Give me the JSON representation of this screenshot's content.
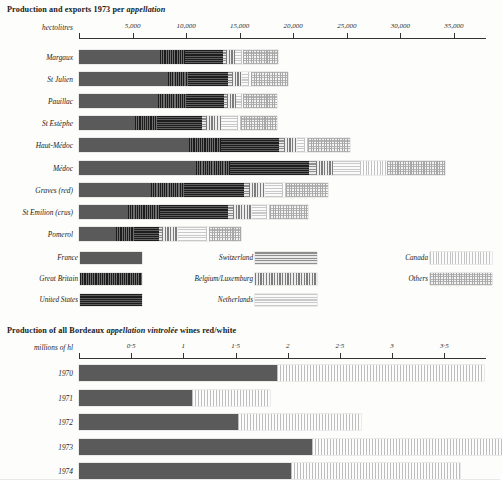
{
  "top_chart": {
    "title_plain_1": "Production and exports 1973 per ",
    "title_italic": "appellation",
    "axis_name": "hectolitres",
    "ticks": [
      "5,000",
      "10,000",
      "15,000",
      "20,000",
      "25,000",
      "30,000",
      "35,000"
    ],
    "tick_values": [
      5000,
      10000,
      15000,
      20000,
      25000,
      30000,
      35000
    ],
    "axis_max": 38000
  },
  "legend": {
    "col1": [
      {
        "label": "France",
        "pattern": "p-france"
      },
      {
        "label": "Great Britain",
        "pattern": "p-gb"
      },
      {
        "label": "United States",
        "pattern": "p-us"
      }
    ],
    "col2": [
      {
        "label": "Switzerland",
        "pattern": "p-swiss"
      },
      {
        "label": "Belgium/Luxemburg",
        "pattern": "p-belux"
      },
      {
        "label": "Netherlands",
        "pattern": "p-neth"
      }
    ],
    "col3": [
      {
        "label": "Canada",
        "pattern": "p-canada"
      },
      {
        "label": "Others",
        "pattern": "p-others"
      }
    ]
  },
  "bottom_chart": {
    "title_plain_1": "Production of all Bordeaux ",
    "title_italic": "appellation vintrolée",
    "title_plain_2": " wines red/white",
    "axis_name": "millions of hl",
    "ticks": [
      "0·5",
      "1",
      "1·5",
      "2",
      "2·5",
      "3",
      "3·5"
    ],
    "tick_values": [
      0.5,
      1,
      1.5,
      2,
      2.5,
      3,
      3.5
    ],
    "axis_max": 3.9
  },
  "chart_data": [
    {
      "type": "bar",
      "orientation": "horizontal",
      "stacked": true,
      "title": "Production and exports 1973 per appellation",
      "xlabel": "hectolitres",
      "ylabel": "",
      "xlim": [
        0,
        38000
      ],
      "grid": false,
      "legend_position": "below-plot",
      "categories": [
        "Margaux",
        "St Julien",
        "Pauillac",
        "St Estèphe",
        "Haut-Médoc",
        "Médoc",
        "Graves (red)",
        "St Emilion (crus)",
        "Pomerol"
      ],
      "series": [
        {
          "name": "France",
          "pattern": "p-france",
          "values": [
            7600,
            8300,
            7400,
            5200,
            10300,
            10900,
            6700,
            4600,
            3500
          ]
        },
        {
          "name": "Great Britain",
          "pattern": "p-gb",
          "values": [
            2300,
            1900,
            2600,
            2100,
            3000,
            3200,
            3100,
            3000,
            1600
          ]
        },
        {
          "name": "United States",
          "pattern": "p-us",
          "values": [
            3500,
            3700,
            3500,
            4200,
            5400,
            7400,
            5600,
            6300,
            2400
          ]
        },
        {
          "name": "Switzerland",
          "pattern": "p-swiss",
          "values": [
            300,
            350,
            300,
            400,
            450,
            600,
            450,
            500,
            250
          ]
        },
        {
          "name": "Belgium/Luxemburg",
          "pattern": "p-belux",
          "values": [
            900,
            1000,
            900,
            1400,
            1200,
            1600,
            1500,
            1800,
            1500
          ]
        },
        {
          "name": "Netherlands",
          "pattern": "p-neth",
          "values": [
            500,
            550,
            450,
            1500,
            700,
            2500,
            1600,
            1300,
            2600
          ]
        },
        {
          "name": "Canada",
          "pattern": "p-canada",
          "values": [
            200,
            250,
            200,
            300,
            350,
            2600,
            400,
            350,
            300
          ]
        },
        {
          "name": "Others",
          "pattern": "p-others",
          "values": [
            3300,
            3450,
            3150,
            3400,
            3900,
            5400,
            3900,
            3500,
            3000
          ]
        }
      ]
    },
    {
      "type": "bar",
      "orientation": "horizontal",
      "stacked": true,
      "title": "Production of all Bordeaux appellation vintrolée wines red/white",
      "xlabel": "millions of hl",
      "ylabel": "",
      "xlim": [
        0,
        3.9
      ],
      "grid": false,
      "categories": [
        "1970",
        "1971",
        "1972",
        "1973",
        "1974"
      ],
      "series": [
        {
          "name": "red",
          "pattern": "p-red",
          "values": [
            1.9,
            1.08,
            1.52,
            2.23,
            2.03
          ]
        },
        {
          "name": "white",
          "pattern": "p-white",
          "values": [
            1.98,
            0.75,
            1.18,
            1.82,
            1.62
          ]
        }
      ]
    }
  ]
}
